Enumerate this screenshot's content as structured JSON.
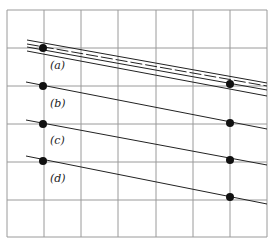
{
  "figure": {
    "grid": {
      "x_lines": [
        7,
        44,
        81,
        118,
        156,
        193,
        230,
        267
      ],
      "y_lines": [
        10,
        48,
        86,
        124,
        162,
        200,
        237
      ],
      "color": "#9a9a9a"
    },
    "panels": [
      {
        "id": "a",
        "label": "(a)",
        "label_pos": [
          50,
          69
        ],
        "dots": [
          [
            43,
            48
          ],
          [
            230,
            84
          ]
        ],
        "lines": [
          {
            "x1": 27,
            "y1": 40,
            "x2": 267,
            "y2": 83,
            "dash": "none"
          },
          {
            "x1": 27,
            "y1": 44,
            "x2": 267,
            "y2": 86,
            "dash": "12,3"
          },
          {
            "x1": 27,
            "y1": 47,
            "x2": 267,
            "y2": 90,
            "dash": "none"
          },
          {
            "x1": 27,
            "y1": 51,
            "x2": 267,
            "y2": 96,
            "dash": "none"
          }
        ]
      },
      {
        "id": "b",
        "label": "(b)",
        "label_pos": [
          50,
          107
        ],
        "dots": [
          [
            43,
            86
          ],
          [
            230,
            123
          ]
        ],
        "lines": [
          {
            "x1": 26,
            "y1": 82,
            "x2": 267,
            "y2": 129,
            "dash": "none"
          }
        ]
      },
      {
        "id": "c",
        "label": "(c)",
        "label_pos": [
          50,
          144
        ],
        "dots": [
          [
            43,
            124
          ],
          [
            230,
            160
          ]
        ],
        "lines": [
          {
            "x1": 26,
            "y1": 120,
            "x2": 267,
            "y2": 165,
            "dash": "none"
          }
        ]
      },
      {
        "id": "d",
        "label": "(d)",
        "label_pos": [
          50,
          182
        ],
        "dots": [
          [
            43,
            161
          ],
          [
            230,
            197
          ]
        ],
        "lines": [
          {
            "x1": 26,
            "y1": 156,
            "x2": 267,
            "y2": 204,
            "dash": "none"
          }
        ]
      }
    ],
    "dot_color": "#111111",
    "line_color": "#222222"
  }
}
